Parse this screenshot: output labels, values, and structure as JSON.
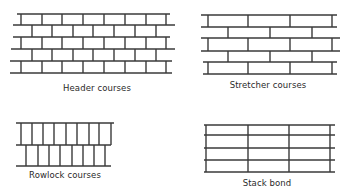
{
  "style": {
    "line_color": "#3a3a3a",
    "background": "#ffffff",
    "line_width": 1.4
  },
  "panels": [
    {
      "id": "header-courses",
      "caption": "Header courses",
      "caption_pos": [
        97,
        90
      ],
      "rows": [
        {
          "y_top": 14,
          "y_bottom": 25,
          "x_start": 17,
          "x_end": 170,
          "joints": [
            21,
            42,
            62,
            83,
            104,
            125,
            146,
            166
          ]
        },
        {
          "y_top": 25,
          "y_bottom": 37,
          "x_start": 13,
          "x_end": 175,
          "joints": [
            32,
            52,
            73,
            93,
            114,
            135,
            156
          ]
        },
        {
          "y_top": 37,
          "y_bottom": 49,
          "x_start": 13,
          "x_end": 170,
          "joints": [
            21,
            42,
            62,
            83,
            104,
            125,
            146,
            166
          ]
        },
        {
          "y_top": 49,
          "y_bottom": 61,
          "x_start": 11,
          "x_end": 175,
          "joints": [
            32,
            52,
            73,
            93,
            114,
            135,
            156
          ]
        },
        {
          "y_top": 61,
          "y_bottom": 73,
          "x_start": 10,
          "x_end": 172,
          "joints": [
            21,
            42,
            62,
            83,
            104,
            125,
            146,
            166
          ]
        }
      ]
    },
    {
      "id": "stretcher-courses",
      "caption": "Stretcher courses",
      "caption_pos": [
        268,
        87
      ],
      "rows": [
        {
          "y_top": 15,
          "y_bottom": 27,
          "x_start": 201,
          "x_end": 337,
          "joints": [
            208,
            248,
            290,
            332
          ]
        },
        {
          "y_top": 27,
          "y_bottom": 38,
          "x_start": 201,
          "x_end": 337,
          "joints": [
            228,
            270,
            312
          ]
        },
        {
          "y_top": 38,
          "y_bottom": 51,
          "x_start": 201,
          "x_end": 340,
          "joints": [
            208,
            248,
            290,
            332
          ]
        },
        {
          "y_top": 51,
          "y_bottom": 62,
          "x_start": 201,
          "x_end": 340,
          "joints": [
            228,
            270,
            312
          ]
        },
        {
          "y_top": 62,
          "y_bottom": 74,
          "x_start": 203,
          "x_end": 337,
          "joints": [
            208,
            248,
            290,
            332
          ]
        }
      ]
    },
    {
      "id": "rowlock-courses",
      "caption": "Rowlock courses",
      "caption_pos": [
        65,
        177
      ],
      "rows": [
        {
          "y_top": 123,
          "y_bottom": 145,
          "x_start": 16,
          "x_end": 114,
          "joints": [
            21,
            32,
            43,
            54,
            66,
            77,
            89,
            99,
            111
          ]
        },
        {
          "y_top": 145,
          "y_bottom": 166,
          "x_start": 16,
          "x_end": 111,
          "joints": [
            26,
            38,
            49,
            60,
            72,
            83,
            94,
            105
          ]
        }
      ]
    },
    {
      "id": "stack-bond",
      "caption": "Stack bond",
      "caption_pos": [
        267,
        185
      ],
      "rows": [
        {
          "y_top": 125,
          "y_bottom": 135,
          "x_start": 204,
          "x_end": 335,
          "joints": [
            206,
            248,
            289,
            330
          ]
        },
        {
          "y_top": 135,
          "y_bottom": 148,
          "x_start": 204,
          "x_end": 335,
          "joints": [
            206,
            248,
            289,
            330
          ]
        },
        {
          "y_top": 148,
          "y_bottom": 160,
          "x_start": 204,
          "x_end": 335,
          "joints": [
            206,
            248,
            289,
            330
          ]
        },
        {
          "y_top": 160,
          "y_bottom": 172,
          "x_start": 204,
          "x_end": 335,
          "joints": [
            206,
            248,
            289,
            330
          ]
        }
      ]
    }
  ]
}
